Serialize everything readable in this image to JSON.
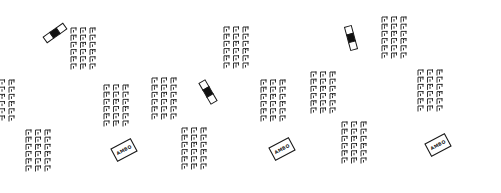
{
  "diagram": {
    "title": "",
    "colors": {
      "ink": "#1a1a1a",
      "background": "#ffffff"
    },
    "panels": [
      {
        "id": "panel-1",
        "ambo": {
          "label": "AMBO",
          "x": 124,
          "y": 150,
          "w": 22,
          "h": 14,
          "angle": -28
        },
        "table": {
          "x": 55,
          "y": 33,
          "angle": -35,
          "cells": [
            "empty",
            "filled",
            "empty"
          ]
        },
        "blocks": [
          {
            "name": "left-upper",
            "x": 14,
            "y": 80,
            "angle": -35,
            "rows": 3,
            "cols": 6
          },
          {
            "name": "left-lower",
            "x": 50,
            "y": 130,
            "angle": -35,
            "rows": 3,
            "cols": 6
          },
          {
            "name": "right-upper",
            "x": 95,
            "y": 28,
            "angle": -35,
            "rows": 3,
            "cols": 6
          },
          {
            "name": "right-lower",
            "x": 128,
            "y": 85,
            "angle": -35,
            "rows": 3,
            "cols": 6
          }
        ]
      },
      {
        "id": "panel-2",
        "ambo": {
          "label": "AMBO",
          "x": 282,
          "y": 149,
          "w": 22,
          "h": 14,
          "angle": -28
        },
        "table": {
          "x": 208,
          "y": 92,
          "angle": 60,
          "cells": [
            "empty",
            "filled",
            "empty"
          ]
        },
        "blocks": [
          {
            "name": "left-upper",
            "x": 176,
            "y": 78,
            "angle": -35,
            "rows": 3,
            "cols": 6
          },
          {
            "name": "left-lower",
            "x": 206,
            "y": 128,
            "angle": -35,
            "rows": 3,
            "cols": 6
          },
          {
            "name": "right-upper",
            "x": 248,
            "y": 27,
            "angle": -35,
            "rows": 3,
            "cols": 6
          },
          {
            "name": "right-lower",
            "x": 285,
            "y": 80,
            "angle": -35,
            "rows": 3,
            "cols": 6
          }
        ]
      },
      {
        "id": "panel-3",
        "ambo": {
          "label": "AMBO",
          "x": 438,
          "y": 145,
          "w": 22,
          "h": 14,
          "angle": -28
        },
        "table": {
          "x": 351,
          "y": 38,
          "angle": 75,
          "cells": [
            "empty",
            "filled",
            "empty"
          ]
        },
        "blocks": [
          {
            "name": "left-upper",
            "x": 335,
            "y": 72,
            "angle": -35,
            "rows": 3,
            "cols": 6
          },
          {
            "name": "left-lower",
            "x": 366,
            "y": 122,
            "angle": -35,
            "rows": 3,
            "cols": 6
          },
          {
            "name": "right-upper",
            "x": 406,
            "y": 17,
            "angle": -35,
            "rows": 3,
            "cols": 6
          },
          {
            "name": "right-lower",
            "x": 442,
            "y": 70,
            "angle": -35,
            "rows": 3,
            "cols": 6
          }
        ]
      }
    ]
  }
}
